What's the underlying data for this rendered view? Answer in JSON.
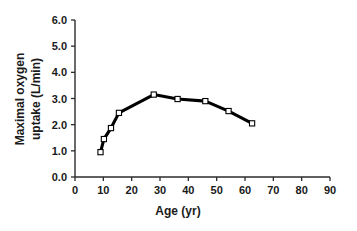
{
  "chart_data": {
    "type": "line",
    "title": "",
    "subtitle": "",
    "xlabel": "Age (yr)",
    "ylabel": "Maximal oxygen uptake (L/min)",
    "ylabel_line1": "Maximal oxygen",
    "ylabel_line2": "uptake (L/min)",
    "xlim": [
      0,
      90
    ],
    "ylim": [
      0,
      6
    ],
    "xticks": [
      0,
      10,
      20,
      30,
      40,
      50,
      60,
      70,
      80,
      90
    ],
    "xtick_labels": [
      "0",
      "10",
      "20",
      "30",
      "40",
      "50",
      "60",
      "70",
      "80",
      "90"
    ],
    "yticks": [
      0,
      1,
      2,
      3,
      4,
      5,
      6
    ],
    "ytick_labels": [
      "0.0",
      "1.0",
      "2.0",
      "3.0",
      "4.0",
      "5.0",
      "6.0"
    ],
    "grid": false,
    "legend": false,
    "legend_position": "none",
    "marker": "open-square",
    "line_color": "#000000",
    "marker_face_color": "#ffffff",
    "marker_edge_color": "#000000",
    "x": [
      9,
      10.2,
      12.7,
      15.5,
      27.8,
      36.2,
      46,
      54.2,
      62.5
    ],
    "y": [
      0.95,
      1.45,
      1.87,
      2.45,
      3.15,
      2.98,
      2.9,
      2.52,
      2.05
    ],
    "series": [
      {
        "name": "Maximal oxygen uptake",
        "x": [
          9,
          10.2,
          12.7,
          15.5,
          27.8,
          36.2,
          46,
          54.2,
          62.5
        ],
        "values": [
          0.95,
          1.45,
          1.87,
          2.45,
          3.15,
          2.98,
          2.9,
          2.52,
          2.05
        ]
      }
    ]
  }
}
